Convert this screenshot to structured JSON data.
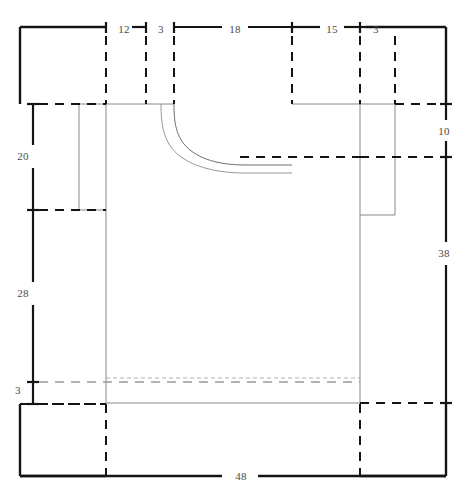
{
  "drawing": {
    "title": "Garment flat technical drawing with dimensions",
    "type": "garment-pattern-schematic",
    "units": "cm",
    "line_color": "#1a1a1a",
    "dim_text_color": "#4a4a4a",
    "garment_outline_color": "#6b6b6b",
    "shading_color": "#8a8a8a",
    "background": "#ffffff"
  },
  "dimensions": {
    "top": [
      {
        "label": "12",
        "from_x": 20,
        "to_x": 106,
        "tick_x": 106,
        "text_x": 124,
        "text_y": 29
      },
      {
        "label": "3",
        "from_x": 132,
        "to_x": 146,
        "tick_x": 146,
        "text_x": 161,
        "text_y": 29
      },
      {
        "label": "18",
        "from_x": 174,
        "to_x": 292,
        "tick_x": 174,
        "text_x": 234,
        "text_y": 29
      },
      {
        "label": "15",
        "from_x": 292,
        "to_x": 345,
        "tick_x": 292,
        "text_x": 332,
        "text_y": 29
      },
      {
        "label": "3",
        "from_x": 352,
        "to_x": 366,
        "tick_x": 360,
        "text_x": 376,
        "text_y": 29
      }
    ],
    "left": [
      {
        "label": "20",
        "from_y": 104,
        "to_y": 210,
        "text_x": 22,
        "text_y": 155
      },
      {
        "label": "28",
        "from_y": 210,
        "to_y": 382,
        "text_x": 22,
        "text_y": 292
      },
      {
        "label": "3",
        "from_y": 382,
        "to_y": 404,
        "text_x": 17,
        "text_y": 388
      }
    ],
    "right": [
      {
        "label": "10",
        "from_y": 104,
        "to_y": 157,
        "text_x": 441,
        "text_y": 130
      },
      {
        "label": "38",
        "from_y": 157,
        "to_y": 403,
        "text_x": 441,
        "text_y": 252
      }
    ],
    "bottom": [
      {
        "label": "48",
        "from_x": 20,
        "to_x": 446,
        "text_x": 241,
        "text_y": 475
      }
    ]
  },
  "measurement_values": {
    "shoulder_left": 12,
    "neck_step_left": 3,
    "neck_width": 18,
    "neck_step_right_span": 15,
    "shoulder_right": 3,
    "upper_body_height": 20,
    "lower_body_height": 28,
    "hem_band_height": 3,
    "sleeve_drop": 10,
    "side_seam_length": 38,
    "total_width": 48
  },
  "frame": {
    "left": 20,
    "top": 27,
    "right": 446,
    "bottom": 476
  },
  "garment": {
    "name": "sweater-flat",
    "body_left_x": 106,
    "body_right_x": 360,
    "shoulder_y": 104,
    "sleeve_right_x": 395,
    "sleeve_bottom_y": 215,
    "hem_top_y": 378,
    "hem_bottom_y": 403,
    "neck_left_x": 174,
    "neck_right_x": 292,
    "neck_depth_y": 157
  }
}
